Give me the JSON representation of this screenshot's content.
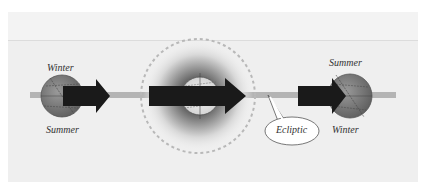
{
  "figure": {
    "labels": {
      "left_top": "Winter",
      "left_bottom": "Summer",
      "right_top": "Summer",
      "right_bottom": "Winter",
      "callout": "Ecliptic"
    },
    "colors": {
      "panel": "#efefef",
      "ecliptic": "#b4b4b4",
      "arrow": "#1a1a1a",
      "earth": "#7a7a7a",
      "dashed_circle": "#b8b8b8"
    }
  }
}
